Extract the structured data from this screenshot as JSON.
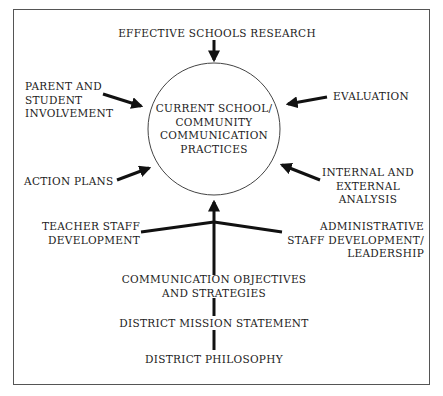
{
  "diagram": {
    "center": "CURRENT SCHOOL/\nCOMMUNITY\nCOMMUNICATION\nPRACTICES",
    "inputs": {
      "top": "EFFECTIVE SCHOOLS RESEARCH",
      "upper_left": "PARENT AND\nSTUDENT\nINVOLVEMENT",
      "upper_right": "EVALUATION",
      "lower_left": "ACTION PLANS",
      "lower_right": "INTERNAL AND\nEXTERNAL\nANALYSIS",
      "branch_left": "TEACHER STAFF\nDEVELOPMENT",
      "branch_right": "ADMINISTRATIVE\nSTAFF DEVELOPMENT/\nLEADERSHIP"
    },
    "foundation_chain": [
      "COMMUNICATION OBJECTIVES\nAND STRATEGIES",
      "DISTRICT MISSION STATEMENT",
      "DISTRICT PHILOSOPHY"
    ]
  }
}
